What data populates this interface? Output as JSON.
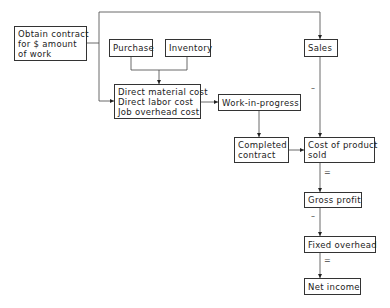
{
  "nodes": {
    "obtain_contract": [
      "Obtain contract",
      "for $ amount",
      "of work"
    ],
    "purchase": [
      "Purchase"
    ],
    "inventory": [
      "Inventory"
    ],
    "direct_costs": [
      "Direct material cost",
      "Direct labor cost",
      "Job overhead cost"
    ],
    "work_in_progress": [
      "Work-in-progress"
    ],
    "completed_contract": [
      "Completed",
      "contract"
    ],
    "sales": [
      "Sales"
    ],
    "cost_of_product_sold": [
      "Cost of product",
      "sold"
    ],
    "gross_profit": [
      "Gross profit"
    ],
    "fixed_overhead": [
      "Fixed overhead"
    ],
    "net_income": [
      "Net income"
    ]
  },
  "operators": {
    "sales_minus": "–",
    "cost_equals": "=",
    "gross_minus": "–",
    "fixed_equals": "="
  },
  "colors": {
    "line": "#333333",
    "text": "#222222"
  }
}
